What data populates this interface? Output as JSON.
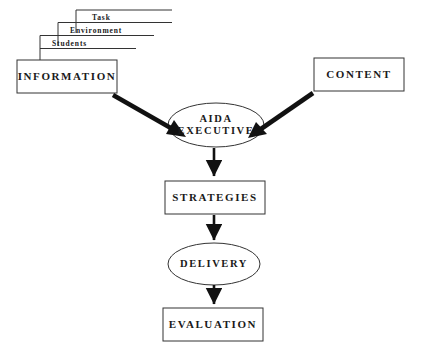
{
  "diagram": {
    "background_color": "#ffffff",
    "stroke_color": "#333333",
    "arrow_color": "#111111",
    "cascade": [
      {
        "label": "Task"
      },
      {
        "label": "Environment"
      },
      {
        "label": "Students"
      }
    ],
    "nodes": {
      "information": {
        "label": "INFORMATION",
        "shape": "rectangle"
      },
      "content": {
        "label": "CONTENT",
        "shape": "rectangle"
      },
      "aida_executive": {
        "label_line1": "AIDA",
        "label_line2": "EXECUTIVE",
        "shape": "ellipse"
      },
      "strategies": {
        "label": "STRATEGIES",
        "shape": "rectangle"
      },
      "delivery": {
        "label": "DELIVERY",
        "shape": "ellipse"
      },
      "evaluation": {
        "label": "EVALUATION",
        "shape": "rectangle"
      }
    },
    "edges": [
      {
        "name": "information-to-aida",
        "from": "information",
        "to": "aida_executive",
        "style": "thick-diagonal-arrow"
      },
      {
        "name": "content-to-aida",
        "from": "content",
        "to": "aida_executive",
        "style": "thick-diagonal-arrow"
      },
      {
        "name": "aida-to-strategies",
        "from": "aida_executive",
        "to": "strategies",
        "style": "vertical-arrow"
      },
      {
        "name": "strategies-to-delivery",
        "from": "strategies",
        "to": "delivery",
        "style": "vertical-arrow"
      },
      {
        "name": "delivery-to-evaluation",
        "from": "delivery",
        "to": "evaluation",
        "style": "vertical-arrow"
      }
    ]
  }
}
